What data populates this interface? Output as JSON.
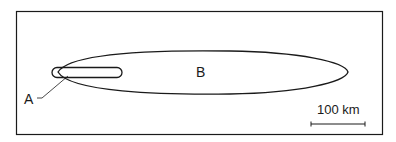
{
  "diagram": {
    "labels": {
      "a": "A",
      "b": "B"
    },
    "scale_bar": {
      "label": "100 km"
    },
    "colors": {
      "stroke": "#1a1a1a",
      "background": "#ffffff"
    }
  }
}
